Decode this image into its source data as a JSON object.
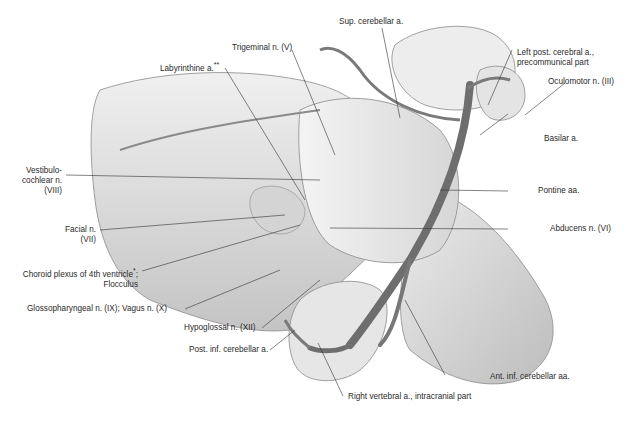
{
  "figure": {
    "type": "anatomical illustration",
    "colors": {
      "background": "#ffffff",
      "tissue_light": "#e8e8e8",
      "tissue_mid": "#c9c9c9",
      "vessel": "#6e6e6e",
      "leader_line": "#333333",
      "text": "#2a2a2a"
    }
  },
  "labels": {
    "sup_cerebellar": "Sup. cerebellar a.",
    "trigeminal": "Trigeminal n. (V)",
    "labyrinthine": "Labyrinthine a.",
    "labyrinthine_mark": "**",
    "left_post_cerebral_1": "Left post. cerebral a.,",
    "left_post_cerebral_2": "precommunical part",
    "oculomotor": "Oculomotor n. (III)",
    "basilar": "Basilar a.",
    "vestibulocochlear_1": "Vestibulo-",
    "vestibulocochlear_2": "cochlear n.",
    "vestibulocochlear_3": "(VIII)",
    "pontine": "Pontine aa.",
    "facial_1": "Facial n.",
    "facial_2": "(VII)",
    "abducens": "Abducens n. (VI)",
    "choroid_1": "Choroid plexus of 4th ventricle",
    "choroid_mark": "*",
    "choroid_sep": ";",
    "choroid_2": "Flocculus",
    "glossopharyngeal": "Glossopharyngeal n. (IX); Vagus n. (X)",
    "hypoglossal": "Hypoglossal n. (XII)",
    "post_inf_cerebellar": "Post. inf. cerebellar a.",
    "ant_inf_cerebellar": "Ant. inf. cerebellar aa.",
    "right_vertebral": "Right vertebral a., intracranial part"
  }
}
